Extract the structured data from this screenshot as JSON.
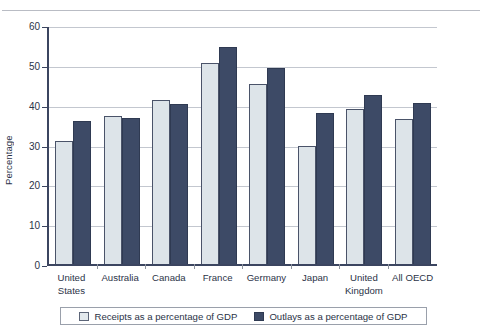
{
  "chart_data": {
    "type": "bar",
    "title": "",
    "subtitle": "",
    "xlabel": "",
    "ylabel": "Percentage",
    "ylim": [
      0,
      60
    ],
    "yticks": [
      0,
      10,
      20,
      30,
      40,
      50,
      60
    ],
    "grid": true,
    "legend_position": "bottom",
    "categories": [
      "United States",
      "Australia",
      "Canada",
      "France",
      "Germany",
      "Japan",
      "United Kingdom",
      "All OECD"
    ],
    "category_lines": [
      [
        "United",
        "States"
      ],
      [
        "Australia"
      ],
      [
        "Canada"
      ],
      [
        "France"
      ],
      [
        "Germany"
      ],
      [
        "Japan"
      ],
      [
        "United",
        "Kingdom"
      ],
      [
        "All OECD"
      ]
    ],
    "series": [
      {
        "name": "Receipts as a percentage of GDP",
        "color": "#dde4e9",
        "values": [
          30.8,
          37.2,
          41.3,
          50.4,
          45.2,
          29.7,
          39.0,
          36.5
        ]
      },
      {
        "name": "Outlays as a percentage of GDP",
        "color": "#3d4a66",
        "values": [
          35.8,
          36.6,
          40.2,
          54.5,
          49.2,
          37.8,
          42.4,
          40.3
        ]
      }
    ]
  },
  "axis": {
    "y_title": "Percentage",
    "y_tick_labels": [
      "60",
      "50",
      "40",
      "30",
      "20",
      "10",
      "0"
    ]
  },
  "legend": {
    "entries": [
      {
        "label": "Receipts as a percentage of GDP",
        "swatch": "receipts-swatch"
      },
      {
        "label": "Outlays as a percentage of GDP",
        "swatch": "outlays-swatch"
      }
    ]
  }
}
